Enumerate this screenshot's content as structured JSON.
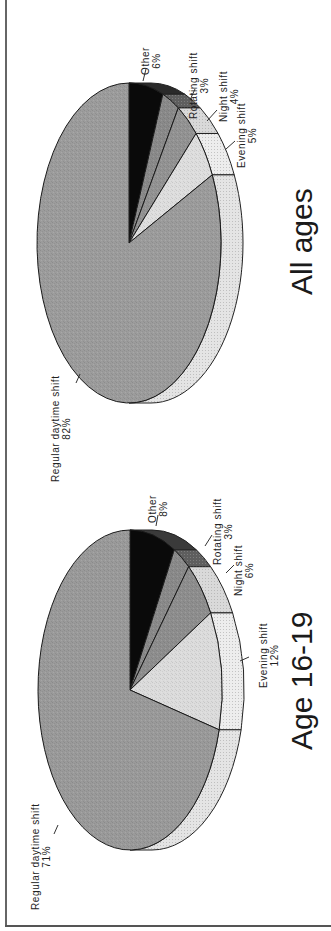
{
  "chart_data": {
    "type": "pie",
    "title": "",
    "orientation": "rotated 90 degrees counter-clockwise",
    "style": "3d",
    "charts": [
      {
        "id": "all-ages",
        "title": "All ages",
        "slices": [
          {
            "label": "Other",
            "value": 6,
            "display": "6%",
            "color": "#0a0a0a",
            "side_color": "#2a2a2a"
          },
          {
            "label": "Rotating shift",
            "value": 3,
            "display": "3%",
            "color": "#8a8a8a",
            "side_color": "#5e5e5e"
          },
          {
            "label": "Night shift",
            "value": 4,
            "display": "4%",
            "color": "#939393",
            "side_color": "#d9d9d9"
          },
          {
            "label": "Evening shift",
            "value": 5,
            "display": "5%",
            "color": "#dedede",
            "side_color": "#ededed"
          },
          {
            "label": "Regular daytime shift",
            "value": 82,
            "display": "82%",
            "color": "#9c9c9c",
            "side_color": "#e4e4e4"
          }
        ]
      },
      {
        "id": "age-16-19",
        "title": "Age 16-19",
        "slices": [
          {
            "label": "Other",
            "value": 8,
            "display": "8%",
            "color": "#0a0a0a",
            "side_color": "#3a3a3a"
          },
          {
            "label": "Rotating shift",
            "value": 3,
            "display": "3%",
            "color": "#8a8a8a",
            "side_color": "#5e5e5e"
          },
          {
            "label": "Night shift",
            "value": 6,
            "display": "6%",
            "color": "#8e8e8e",
            "side_color": "#d9d9d9"
          },
          {
            "label": "Evening shift",
            "value": 12,
            "display": "12%",
            "color": "#dcdcdc",
            "side_color": "#ededed"
          },
          {
            "label": "Regular daytime shift",
            "value": 71,
            "display": "71%",
            "color": "#9a9a9a",
            "side_color": "#e4e4e4"
          }
        ]
      }
    ]
  },
  "panels": {
    "all_ages": {
      "title": "All ages",
      "labels": {
        "other": {
          "name": "Other",
          "pct": "6%"
        },
        "rotating": {
          "name": "Rotating shift",
          "pct": "3%"
        },
        "night": {
          "name": "Night shift",
          "pct": "4%"
        },
        "evening": {
          "name": "Evening shift",
          "pct": "5%"
        },
        "regular": {
          "name": "Regular daytime shift",
          "pct": "82%"
        }
      }
    },
    "age_16_19": {
      "title": "Age 16-19",
      "labels": {
        "other": {
          "name": "Other",
          "pct": "8%"
        },
        "rotating": {
          "name": "Rotating shift",
          "pct": "3%"
        },
        "night": {
          "name": "Night shift",
          "pct": "6%"
        },
        "evening": {
          "name": "Evening shift",
          "pct": "12%"
        },
        "regular": {
          "name": "Regular daytime shift",
          "pct": "71%"
        }
      }
    }
  }
}
